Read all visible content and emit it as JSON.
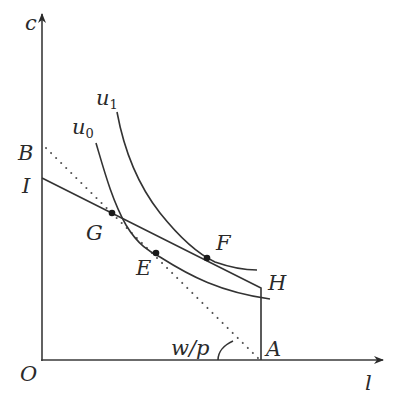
{
  "diagram": {
    "type": "economics-labor-leisure-indifference",
    "axes": {
      "y_label": "c",
      "x_label": "l",
      "origin_label": "O"
    },
    "points": {
      "B": "B",
      "I": "I",
      "G": "G",
      "E": "E",
      "F": "F",
      "H": "H",
      "A": "A"
    },
    "curves": {
      "u0": {
        "base": "u",
        "sub": "0"
      },
      "u1": {
        "base": "u",
        "sub": "1"
      }
    },
    "angle_label": "w/p",
    "colors": {
      "line": "#333333",
      "background": "#ffffff"
    }
  }
}
